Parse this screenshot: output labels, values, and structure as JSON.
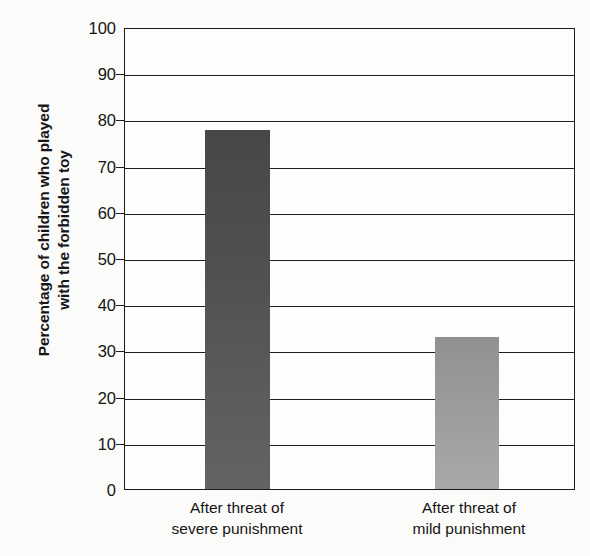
{
  "chart_data": {
    "type": "bar",
    "title": "",
    "subtitle": "",
    "xlabel": "",
    "ylabel": "Percentage of children who played with the forbidden toy",
    "ylabel_lines": [
      "Percentage of children who played",
      "with the forbidden toy"
    ],
    "categories": [
      "After threat of severe punishment",
      "After threat of mild punishment"
    ],
    "category_lines": [
      [
        "After threat of",
        "severe punishment"
      ],
      [
        "After threat of",
        "mild punishment"
      ]
    ],
    "values": [
      78,
      33
    ],
    "ylim": [
      0,
      100
    ],
    "ytick_values": [
      0,
      10,
      20,
      30,
      40,
      50,
      60,
      70,
      80,
      90,
      100
    ],
    "ytick_labels": [
      "0",
      "10",
      "20",
      "30",
      "40",
      "50",
      "60",
      "70",
      "80",
      "90",
      "100"
    ],
    "grid": true,
    "grid_axis": "y",
    "legend": false,
    "legend_position": "none",
    "bar_colors": [
      "#4f4f4f",
      "#9b9b9b"
    ],
    "annotations": []
  },
  "colors": {
    "background": "#fbfbf9",
    "plot_background": "#fdfdfb",
    "axis": "#1b1b1b",
    "gridline": "#1d1d1d",
    "text": "#141414",
    "bar_dark": "#4f4f4f",
    "bar_light": "#9b9b9b"
  }
}
